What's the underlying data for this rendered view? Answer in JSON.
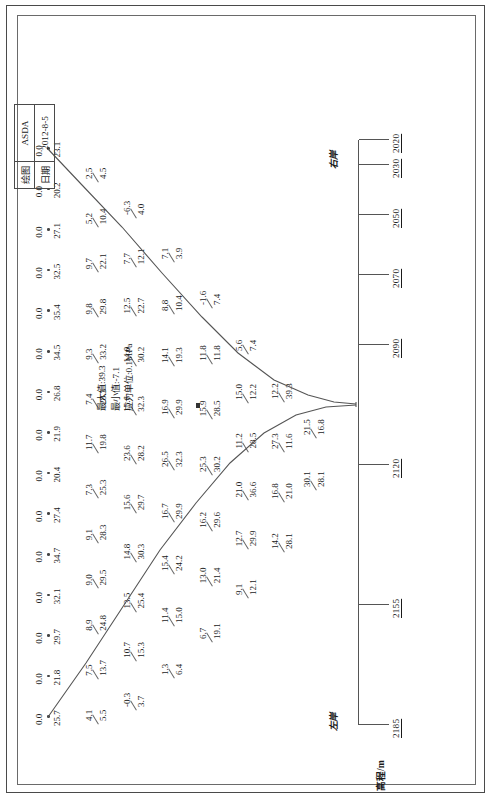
{
  "sheet": {
    "axis_title": "高程/m",
    "left_bank": "左岸",
    "right_bank": "右岸"
  },
  "notes": {
    "max": "最大值:39.3",
    "min": "最小值:-7.1",
    "unit": "应力单位:0.1MPa"
  },
  "title_block": {
    "draw_key": "绘图",
    "draw_val": "ASDA",
    "date_key": "日期",
    "date_val": "2012-8-5"
  },
  "chart_data": {
    "type": "line",
    "title": "",
    "xlabel": "高程/m",
    "ylabel": "",
    "grid": false,
    "legend": "none",
    "unit": "0.1MPa",
    "max_value": 39.3,
    "min_value": -7.1,
    "elevations": [
      2185,
      2155,
      2120,
      2090,
      2070,
      2050,
      2030,
      2020
    ],
    "surface_zero_row": [
      "0.0",
      "0.0",
      "0.0",
      "0.0",
      "0.0",
      "0.0",
      "0.0",
      "0.0",
      "0.0",
      "0.0",
      "0.0",
      "0.0",
      "0.0",
      "0.0",
      "0.0"
    ],
    "crest_row": [
      "25.7",
      "21.8",
      "29.7",
      "32.1",
      "34.7",
      "27.4",
      "20.4",
      "21.9",
      "26.8",
      "34.5",
      "35.4",
      "32.5",
      "27.1",
      "20.2",
      "23.1"
    ],
    "rows": [
      {
        "elevation": 2155,
        "upper": [
          "4.1",
          "7.5",
          "8.9",
          "9.0",
          "9.1",
          "7.3",
          "11.7",
          "7.4",
          "9.3",
          "9.8",
          "9.7",
          "5.2",
          "2.5"
        ],
        "lower": [
          "5.5",
          "13.7",
          "24.8",
          "29.5",
          "28.3",
          "25.3",
          "19.8",
          "28.3",
          "33.2",
          "29.8",
          "22.1",
          "10.4",
          "4.5"
        ]
      },
      {
        "elevation": 2120,
        "upper": [
          "-0.3",
          "10.7",
          "13.5",
          "14.8",
          "15.6",
          "23.6",
          "15.6",
          "14.0",
          "12.5",
          "7.7",
          "-6.3"
        ],
        "lower": [
          "3.7",
          "15.3",
          "25.4",
          "30.3",
          "29.7",
          "28.2",
          "32.3",
          "30.2",
          "22.7",
          "12.1",
          "4.0"
        ]
      },
      {
        "elevation": 2090,
        "upper": [
          "1.3",
          "11.4",
          "15.4",
          "16.7",
          "26.5",
          "16.9",
          "14.1",
          "8.8",
          "7.1"
        ],
        "lower": [
          "6.4",
          "15.0",
          "24.2",
          "29.9",
          "32.3",
          "29.9",
          "19.3",
          "10.4",
          "3.9"
        ]
      },
      {
        "elevation": 2070,
        "upper": [
          "6.7",
          "13.0",
          "16.2",
          "25.3",
          "15.9",
          "11.8",
          "-1.6"
        ],
        "lower": [
          "19.1",
          "21.4",
          "29.6",
          "30.2",
          "28.5",
          "11.8",
          "7.4"
        ]
      },
      {
        "elevation": 2050,
        "upper": [
          "9.1",
          "12.7",
          "21.0",
          "11.2",
          "15.0",
          "5.6"
        ],
        "lower": [
          "12.1",
          "29.9",
          "36.6",
          "28.5",
          "12.2",
          "7.4"
        ]
      },
      {
        "elevation": 2030,
        "upper": [
          "14.2",
          "16.8",
          "27.3",
          "12.2"
        ],
        "lower": [
          "28.1",
          "21.0",
          "11.6",
          "39.3"
        ]
      },
      {
        "elevation": 2020,
        "upper": [
          "30.1",
          "21.5"
        ],
        "lower": [
          "28.1",
          "16.8"
        ]
      }
    ],
    "annotations": [
      "39.3",
      "16.8",
      "30.1",
      "28.1",
      "21.5",
      "11.6",
      "27.3",
      "12.2"
    ]
  }
}
